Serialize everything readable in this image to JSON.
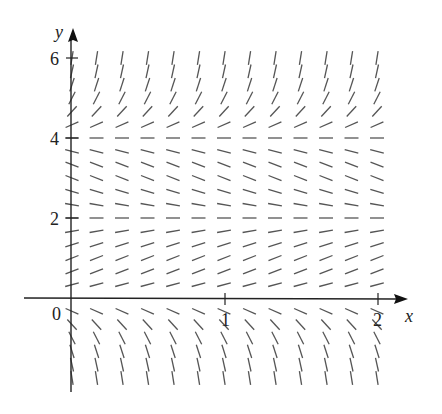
{
  "chart_data": {
    "type": "slope_field",
    "title": "",
    "equation": "dy/dx = y(y-2)(y-4)",
    "xlabel": "x",
    "ylabel": "y",
    "x_ticks": [
      {
        "value": 0,
        "label": "0"
      },
      {
        "value": 1,
        "label": "1"
      },
      {
        "value": 2,
        "label": "2"
      }
    ],
    "y_ticks": [
      {
        "value": 2,
        "label": "2"
      },
      {
        "value": 4,
        "label": "4"
      },
      {
        "value": 6,
        "label": "6"
      }
    ],
    "xlim": [
      -0.3,
      2.3
    ],
    "ylim": [
      -2.4,
      7.3
    ],
    "grid": false,
    "columns_x": [
      0.1667,
      0.3333,
      0.5,
      0.6667,
      0.8333,
      1.0,
      1.1667,
      1.3333,
      1.5,
      1.6667,
      1.8333,
      2.0
    ],
    "row_step": 0.3333,
    "row_range": [
      -2,
      6
    ],
    "equilibrium_lines_y": [
      0,
      2,
      4
    ],
    "segment_length_px": 14,
    "colors": {
      "axis": "#222222",
      "segment": "#555555",
      "background": "#ffffff"
    }
  },
  "axes": {
    "x_label": "x",
    "y_label": "y",
    "origin_label": "0",
    "x_tick_labels": [
      "1",
      "2"
    ],
    "y_tick_labels": [
      "2",
      "4",
      "6"
    ]
  }
}
